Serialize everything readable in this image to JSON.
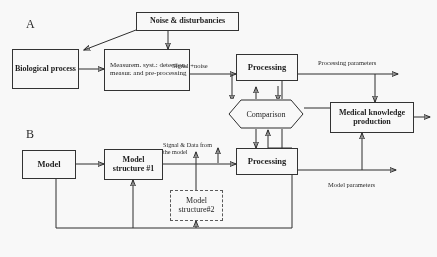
{
  "figure": {
    "type": "block-diagram",
    "title": "",
    "sections": [
      {
        "id": "A",
        "letter": "A"
      },
      {
        "id": "B",
        "letter": "B"
      }
    ]
  },
  "nodes": {
    "noise": {
      "label": "Noise & disturbancies"
    },
    "biological_process": {
      "label": "Biological\nprocess"
    },
    "measurement_system": {
      "label": "Measurem. syst.:\ndetection, measur.\nand pre-processing"
    },
    "processing_top": {
      "label": "Processing"
    },
    "comparison": {
      "label": "Comparison"
    },
    "medical_knowledge": {
      "label": "Medical knowledge\nproduction"
    },
    "model": {
      "label": "Model"
    },
    "model_structure_1": {
      "label": "Model\nstructure #1"
    },
    "model_structure_2": {
      "label": "Model\nstructure#2"
    },
    "processing_bottom": {
      "label": "Processing"
    }
  },
  "edge_labels": {
    "signal_plus_noise": "Signal +noise",
    "processing_parameters": "Processing parameters",
    "signal_and_data_from_model": "Signal & Data from\nthe model",
    "model_parameters": "Model parameters"
  },
  "colors": {
    "stroke": "#262626",
    "dashed_stroke": "#555555",
    "text": "#151515",
    "background": "#fdfdfd"
  }
}
